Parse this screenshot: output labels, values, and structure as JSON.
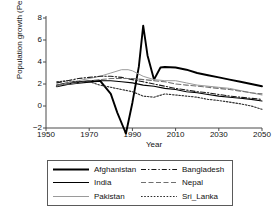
{
  "chart_data": {
    "type": "line",
    "title": "",
    "xlabel": "Year",
    "ylabel": "Population growth (Per cent)",
    "xlim": [
      1950,
      2050
    ],
    "ylim": [
      -2,
      8
    ],
    "xticks": [
      1950,
      1970,
      1990,
      2010,
      2030,
      2050
    ],
    "yticks": [
      -2,
      0,
      2,
      4,
      6,
      8
    ],
    "grid": false,
    "legend_position": "below-plot",
    "series": [
      {
        "name": "Afghanistan",
        "style": "solid",
        "color": "#000000",
        "width": 1.9,
        "x": [
          1955,
          1960,
          1965,
          1970,
          1975,
          1980,
          1983,
          1987,
          1990,
          1993,
          1995,
          1997,
          2000,
          2003,
          2005,
          2010,
          2015,
          2020,
          2025,
          2030,
          2035,
          2040,
          2045,
          2050
        ],
        "y": [
          1.8,
          2.0,
          2.1,
          2.2,
          2.3,
          1.1,
          -0.6,
          -2.5,
          0.3,
          3.6,
          7.3,
          4.6,
          2.4,
          3.5,
          3.55,
          3.5,
          3.3,
          3.0,
          2.8,
          2.6,
          2.4,
          2.2,
          2.0,
          1.8
        ]
      },
      {
        "name": "India",
        "style": "solid",
        "color": "#000000",
        "width": 1.1,
        "x": [
          1955,
          1960,
          1965,
          1970,
          1975,
          1980,
          1985,
          1990,
          1995,
          2000,
          2005,
          2010,
          2015,
          2020,
          2025,
          2030,
          2035,
          2040,
          2045,
          2050
        ],
        "y": [
          1.9,
          2.1,
          2.2,
          2.3,
          2.3,
          2.3,
          2.2,
          2.1,
          1.9,
          1.8,
          1.6,
          1.5,
          1.3,
          1.2,
          1.05,
          0.9,
          0.8,
          0.7,
          0.6,
          0.45
        ]
      },
      {
        "name": "Pakistan",
        "style": "solid",
        "color": "#9a9a9a",
        "width": 1.0,
        "x": [
          1955,
          1960,
          1965,
          1970,
          1975,
          1980,
          1985,
          1988,
          1990,
          1995,
          2000,
          2005,
          2010,
          2015,
          2020,
          2025,
          2030,
          2035,
          2040,
          2045,
          2050
        ],
        "y": [
          1.8,
          2.1,
          2.3,
          2.5,
          2.7,
          3.0,
          3.3,
          3.3,
          3.2,
          2.7,
          2.4,
          2.3,
          2.3,
          2.1,
          1.9,
          1.8,
          1.7,
          1.6,
          1.4,
          1.2,
          1.0
        ]
      },
      {
        "name": "Bangladesh",
        "style": "dashdot",
        "color": "#1a1a1a",
        "width": 1.1,
        "x": [
          1955,
          1960,
          1965,
          1970,
          1975,
          1980,
          1985,
          1990,
          1995,
          2000,
          2005,
          2010,
          2015,
          2020,
          2025,
          2030,
          2035,
          2040,
          2045,
          2050
        ],
        "y": [
          2.1,
          2.3,
          2.5,
          2.6,
          2.7,
          2.7,
          2.6,
          2.4,
          2.2,
          2.0,
          1.8,
          1.6,
          1.45,
          1.3,
          1.2,
          1.05,
          0.9,
          0.8,
          0.7,
          0.6
        ]
      },
      {
        "name": "Nepal",
        "style": "dashed",
        "color": "#6f6f6f",
        "width": 1.1,
        "x": [
          1955,
          1960,
          1965,
          1970,
          1975,
          1980,
          1985,
          1990,
          1995,
          2000,
          2005,
          2010,
          2015,
          2020,
          2025,
          2030,
          2035,
          2040,
          2045,
          2050
        ],
        "y": [
          1.9,
          2.0,
          2.1,
          2.3,
          2.4,
          2.5,
          2.5,
          2.5,
          2.4,
          2.3,
          2.2,
          2.0,
          1.9,
          1.8,
          1.7,
          1.6,
          1.5,
          1.35,
          1.2,
          1.1
        ]
      },
      {
        "name": "Sri_Lanka",
        "style": "dotted",
        "color": "#2b2b2b",
        "width": 1.1,
        "x": [
          1955,
          1960,
          1965,
          1970,
          1975,
          1980,
          1985,
          1990,
          1995,
          2000,
          2005,
          2010,
          2015,
          2020,
          2025,
          2030,
          2035,
          2040,
          2045,
          2050
        ],
        "y": [
          2.2,
          2.3,
          2.2,
          2.2,
          1.9,
          1.7,
          1.5,
          1.3,
          0.9,
          0.8,
          1.1,
          1.0,
          0.9,
          0.8,
          0.6,
          0.5,
          0.35,
          0.2,
          0.0,
          -0.3
        ]
      }
    ]
  },
  "legend": {
    "entries": [
      {
        "label": "Afghanistan"
      },
      {
        "label": "Bangladesh"
      },
      {
        "label": "India"
      },
      {
        "label": "Nepal"
      },
      {
        "label": "Pakistan"
      },
      {
        "label": "Sri_Lanka"
      }
    ]
  }
}
